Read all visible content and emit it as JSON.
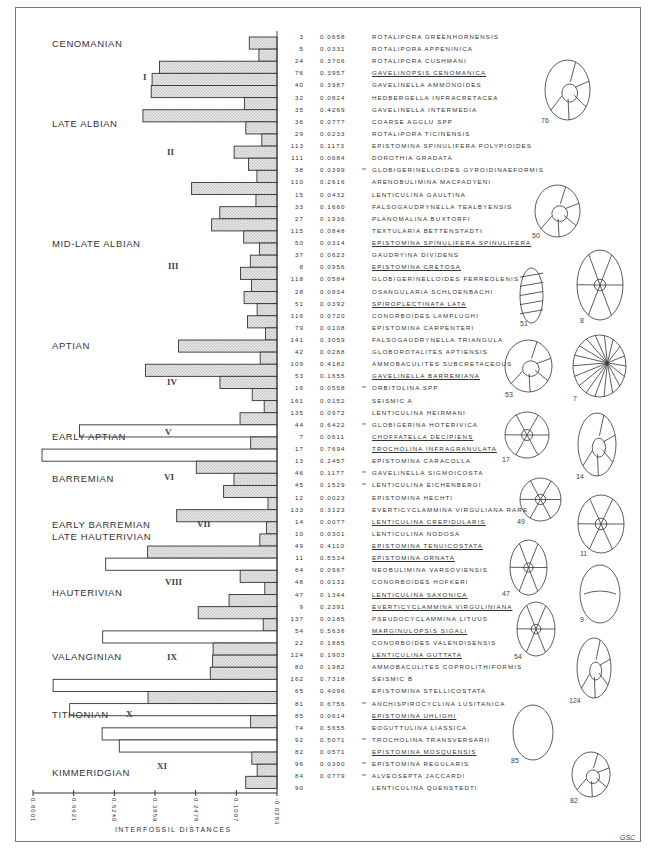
{
  "figure": {
    "credit": "GSC",
    "axis_title": "INTERFOSSIL DISTANCES",
    "axis_ticks": [
      "0.8001",
      "0.6621",
      "0.5240",
      "0.3859",
      "0.2478",
      "0.1097",
      "-0.0283"
    ]
  },
  "stages": [
    {
      "label": "CENOMANIAN",
      "top": 37
    },
    {
      "label": "LATE ALBIAN",
      "top": 117
    },
    {
      "label": "MID-LATE ALBIAN",
      "top": 237
    },
    {
      "label": "APTIAN",
      "top": 339
    },
    {
      "label": "EARLY APTIAN",
      "top": 430
    },
    {
      "label": "BARREMIAN",
      "top": 472
    },
    {
      "label": "EARLY BARREMIAN",
      "top": 518
    },
    {
      "label": "LATE HAUTERIVIAN",
      "top": 530
    },
    {
      "label": "HAUTERIVIAN",
      "top": 586
    },
    {
      "label": "VALANGINIAN",
      "top": 650
    },
    {
      "label": "TITHONIAN",
      "top": 708
    },
    {
      "label": "KIMMERIDGIAN",
      "top": 766
    }
  ],
  "clusters": [
    {
      "label": "I",
      "left": 143,
      "top": 72
    },
    {
      "label": "II",
      "left": 167,
      "top": 147
    },
    {
      "label": "III",
      "left": 168,
      "top": 261
    },
    {
      "label": "IV",
      "left": 167,
      "top": 377
    },
    {
      "label": "V",
      "left": 165,
      "top": 427
    },
    {
      "label": "VI",
      "left": 164,
      "top": 472
    },
    {
      "label": "VII",
      "left": 197,
      "top": 519
    },
    {
      "label": "VIII",
      "left": 165,
      "top": 577
    },
    {
      "label": "IX",
      "left": 167,
      "top": 652
    },
    {
      "label": "X",
      "left": 126,
      "top": 709
    },
    {
      "label": "XI",
      "left": 157,
      "top": 761
    }
  ],
  "chart_data": {
    "type": "dendrogram",
    "title": "",
    "xlabel": "INTERFOSSIL DISTANCES",
    "xlim": [
      0.8001,
      -0.0283
    ],
    "x_ticks": [
      0.8001,
      0.6621,
      0.524,
      0.3859,
      0.2478,
      0.1097,
      -0.0283
    ],
    "columns": [
      "Taxon no.",
      "Interfossil distance",
      "Taxon"
    ],
    "note": "** marks taxa flagged with double asterisk; underlined taxa are illustrated",
    "rows": [
      {
        "no": "3",
        "dist": "0.0658",
        "name": "ROTALIPORA GREENHORNENSIS",
        "mark": "",
        "u": false
      },
      {
        "no": "5",
        "dist": "0.0331",
        "name": "ROTALIPORA APPENINICA",
        "mark": "",
        "u": false
      },
      {
        "no": "24",
        "dist": "0.3706",
        "name": "ROTALIPORA CUSHMANI",
        "mark": "",
        "u": false
      },
      {
        "no": "76",
        "dist": "0.3957",
        "name": "GAVELINOPSIS CENOMANICA",
        "mark": "",
        "u": true
      },
      {
        "no": "40",
        "dist": "0.3987",
        "name": "GAVELINELLA AMMONOIDES",
        "mark": "",
        "u": false
      },
      {
        "no": "32",
        "dist": "0.0824",
        "name": "HEDBERGELLA INFRACRETACEA",
        "mark": "",
        "u": false
      },
      {
        "no": "35",
        "dist": "0.4269",
        "name": "GAVELINELLA INTERMEDIA",
        "mark": "",
        "u": false
      },
      {
        "no": "36",
        "dist": "0.0777",
        "name": "COARSE AGGLU SPP",
        "mark": "",
        "u": false
      },
      {
        "no": "29",
        "dist": "0.0233",
        "name": "ROTALIPORA TICINENSIS",
        "mark": "",
        "u": false
      },
      {
        "no": "113",
        "dist": "0.1173",
        "name": "EPISTOMINA SPINULIFERA POLYPIOIDES",
        "mark": "",
        "u": false
      },
      {
        "no": "111",
        "dist": "0.0684",
        "name": "DOROTHIA GRADATA",
        "mark": "",
        "u": false
      },
      {
        "no": "38",
        "dist": "0.0399",
        "name": "GLOBIGERINELLOIDES GYROIDINAEFORMIS",
        "mark": "**",
        "u": false
      },
      {
        "no": "110",
        "dist": "0.2616",
        "name": "ARENOBULIMINA MACFADYENI",
        "mark": "",
        "u": false
      },
      {
        "no": "15",
        "dist": "0.0432",
        "name": "LENTICULINA GAULTINA",
        "mark": "",
        "u": false
      },
      {
        "no": "33",
        "dist": "0.1660",
        "name": "FALSOGAUDRYNELLA TEALBYENSIS",
        "mark": "",
        "u": false
      },
      {
        "no": "27",
        "dist": "0.1936",
        "name": "PLANOMALINA BUXTORFI",
        "mark": "",
        "u": false
      },
      {
        "no": "115",
        "dist": "0.0848",
        "name": "TEXTULARIA BETTENSTADTI",
        "mark": "",
        "u": false
      },
      {
        "no": "50",
        "dist": "0.0314",
        "name": "EPISTOMINA SPINULIFERA SPINULIFERA",
        "mark": "",
        "u": true
      },
      {
        "no": "37",
        "dist": "0.0623",
        "name": "GAUDRYINA DIVIDENS",
        "mark": "",
        "u": false
      },
      {
        "no": "8",
        "dist": "0.0956",
        "name": "EPISTOMINA CRETOSA",
        "mark": "",
        "u": true
      },
      {
        "no": "118",
        "dist": "0.0584",
        "name": "GLOBIGERINELLOIDES FERREOLENIS",
        "mark": "",
        "u": false
      },
      {
        "no": "28",
        "dist": "0.0834",
        "name": "OSANGULARIA SCHLOENBACHI",
        "mark": "",
        "u": false
      },
      {
        "no": "51",
        "dist": "0.0392",
        "name": "SPIROPLECTINATA LATA",
        "mark": "",
        "u": true
      },
      {
        "no": "116",
        "dist": "0.0720",
        "name": "CONORBOIDES LAMPLUGHI",
        "mark": "",
        "u": false
      },
      {
        "no": "79",
        "dist": "0.0108",
        "name": "EPISTOMINA CARPENTERI",
        "mark": "",
        "u": false
      },
      {
        "no": "141",
        "dist": "0.3059",
        "name": "FALSOGAUDRYNELLA TRIANGULA",
        "mark": "",
        "u": false
      },
      {
        "no": "42",
        "dist": "0.0288",
        "name": "GLOBOROTALITES APTIENSIS",
        "mark": "",
        "u": false
      },
      {
        "no": "109",
        "dist": "0.4182",
        "name": "AMMOBACULITES SUBCRETACEOUS",
        "mark": "",
        "u": false
      },
      {
        "no": "53",
        "dist": "0.1655",
        "name": "GAVELINELLA BARREMIANA",
        "mark": "",
        "u": true
      },
      {
        "no": "16",
        "dist": "0.0558",
        "name": "ORBITOLINA SPP",
        "mark": "**",
        "u": false
      },
      {
        "no": "161",
        "dist": "0.0152",
        "name": "SEISMIC A",
        "mark": "",
        "u": false
      },
      {
        "no": "135",
        "dist": "0.0972",
        "name": "LENTICULINA HEIRMANI",
        "mark": "",
        "u": false
      },
      {
        "no": "44",
        "dist": "0.6422",
        "name": "GLOBIGERINA HOTERIVICA",
        "mark": "**",
        "u": false
      },
      {
        "no": "7",
        "dist": "0.0611",
        "name": "CHOFFATELLA DECIPIENS",
        "mark": "",
        "u": true
      },
      {
        "no": "17",
        "dist": "0.7694",
        "name": "TROCHOLINA INFRAGRANULATA",
        "mark": "",
        "u": true
      },
      {
        "no": "13",
        "dist": "0.2457",
        "name": "EPISTOMINA CARACOLLA",
        "mark": "",
        "u": false
      },
      {
        "no": "46",
        "dist": "0.1177",
        "name": "GAVELINELLA SIGMOICOSTA",
        "mark": "**",
        "u": false
      },
      {
        "no": "45",
        "dist": "0.1529",
        "name": "LENTICULINA EICHENBERGI",
        "mark": "**",
        "u": false
      },
      {
        "no": "12",
        "dist": "0.0023",
        "name": "EPISTOMINA HECHTI",
        "mark": "",
        "u": false
      },
      {
        "no": "133",
        "dist": "0.3123",
        "name": "EVERTICYCLAMMINA VIRGULIANA RARE",
        "mark": "",
        "u": false
      },
      {
        "no": "14",
        "dist": "0.0077",
        "name": "LENTICULINA CREPIDULARIS",
        "mark": "",
        "u": true
      },
      {
        "no": "10",
        "dist": "0.0301",
        "name": "LENTICULINA NODOSA",
        "mark": "",
        "u": false
      },
      {
        "no": "49",
        "dist": "0.4110",
        "name": "EPISTOMINA TENUICOSTATA",
        "mark": "",
        "u": true
      },
      {
        "no": "11",
        "dist": "0.5534",
        "name": "EPISTOMINA ORNATA",
        "mark": "",
        "u": true
      },
      {
        "no": "64",
        "dist": "0.0967",
        "name": "NEOBULIMINA VARSOVIENSIS",
        "mark": "",
        "u": false
      },
      {
        "no": "48",
        "dist": "0.0132",
        "name": "CONORBOIDES HOFKERI",
        "mark": "",
        "u": false
      },
      {
        "no": "47",
        "dist": "0.1344",
        "name": "LENTICULINA SAXONICA",
        "mark": "",
        "u": true
      },
      {
        "no": "9",
        "dist": "0.2391",
        "name": "EVERTICYCLAMMINA VIRGULINIANA",
        "mark": "",
        "u": true
      },
      {
        "no": "137",
        "dist": "0.0185",
        "name": "PSEUDOCYCLAMMINA LITUUS",
        "mark": "",
        "u": false
      },
      {
        "no": "54",
        "dist": "0.5636",
        "name": "MARGINULOPSIS SIGALI",
        "mark": "",
        "u": true
      },
      {
        "no": "22",
        "dist": "0.1885",
        "name": "CONORBOIDES VALENDISENSIS",
        "mark": "",
        "u": false
      },
      {
        "no": "124",
        "dist": "0.1903",
        "name": "LENTICULINA GUTTATA",
        "mark": "",
        "u": true
      },
      {
        "no": "80",
        "dist": "0.1982",
        "name": "AMMOBACULITES COPROLITHIFORMIS",
        "mark": "",
        "u": false
      },
      {
        "no": "162",
        "dist": "0.7318",
        "name": "SEISMIC B",
        "mark": "",
        "u": false
      },
      {
        "no": "65",
        "dist": "0.4096",
        "name": "EPISTOMINA STELLICOSTATA",
        "mark": "",
        "u": false
      },
      {
        "no": "81",
        "dist": "0.6756",
        "name": "ANCHISPIROCYCLINA LUSITANICA",
        "mark": "**",
        "u": false
      },
      {
        "no": "85",
        "dist": "0.0614",
        "name": "EPISTOMINA UHLIGHI",
        "mark": "",
        "u": true
      },
      {
        "no": "74",
        "dist": "0.5655",
        "name": "EOGUTTULINA LIASSICA",
        "mark": "",
        "u": false
      },
      {
        "no": "92",
        "dist": "0.5071",
        "name": "TROCHOLINA TRANSVERSARII",
        "mark": "**",
        "u": false
      },
      {
        "no": "82",
        "dist": "0.0571",
        "name": "EPISTOMINA MOSQUENSIS",
        "mark": "",
        "u": true
      },
      {
        "no": "96",
        "dist": "0.0390",
        "name": "EPISTOMINA REGULARIS",
        "mark": "**",
        "u": false
      },
      {
        "no": "84",
        "dist": "0.0779",
        "name": "ALVEOSEPTA JACCARDI",
        "mark": "**",
        "u": false
      },
      {
        "no": "90",
        "dist": "",
        "name": "LENTICULINA QUENSTEDTI",
        "mark": "",
        "u": false
      }
    ]
  },
  "illustrations": [
    {
      "label": "76",
      "shape": "planispiral",
      "x": 545,
      "y": 60,
      "w": 45,
      "h": 60,
      "lx": 541,
      "ly": 117
    },
    {
      "label": "50",
      "shape": "trochospiral-umbilical",
      "x": 535,
      "y": 185,
      "w": 45,
      "h": 52,
      "lx": 532,
      "ly": 232
    },
    {
      "label": "51",
      "shape": "biserial",
      "x": 520,
      "y": 268,
      "w": 23,
      "h": 55,
      "lx": 520,
      "ly": 320
    },
    {
      "label": "8",
      "shape": "chambered-polygonal",
      "x": 577,
      "y": 250,
      "w": 46,
      "h": 70,
      "lx": 580,
      "ly": 317
    },
    {
      "label": "53",
      "shape": "trochospiral",
      "x": 505,
      "y": 340,
      "w": 47,
      "h": 52,
      "lx": 505,
      "ly": 391
    },
    {
      "label": "7",
      "shape": "radial-striate",
      "x": 573,
      "y": 335,
      "w": 53,
      "h": 62,
      "lx": 573,
      "ly": 395
    },
    {
      "label": "17",
      "shape": "disc-ornamented",
      "x": 505,
      "y": 412,
      "w": 44,
      "h": 46,
      "lx": 502,
      "ly": 456
    },
    {
      "label": "14",
      "shape": "elongate-planispiral",
      "x": 578,
      "y": 413,
      "w": 38,
      "h": 63,
      "lx": 576,
      "ly": 473
    },
    {
      "label": "49",
      "shape": "radial-sutured",
      "x": 520,
      "y": 478,
      "w": 41,
      "h": 43,
      "lx": 517,
      "ly": 518
    },
    {
      "label": "11",
      "shape": "chambered-polygonal",
      "x": 578,
      "y": 495,
      "w": 46,
      "h": 58,
      "lx": 580,
      "ly": 550
    },
    {
      "label": "47",
      "shape": "lobate",
      "x": 510,
      "y": 540,
      "w": 37,
      "h": 55,
      "lx": 502,
      "ly": 590
    },
    {
      "label": "9",
      "shape": "dome",
      "x": 580,
      "y": 565,
      "w": 40,
      "h": 58,
      "lx": 580,
      "ly": 616
    },
    {
      "label": "54",
      "shape": "alveolar",
      "x": 517,
      "y": 602,
      "w": 38,
      "h": 54,
      "lx": 514,
      "ly": 653
    },
    {
      "label": "124",
      "shape": "evolute-planispiral",
      "x": 577,
      "y": 638,
      "w": 34,
      "h": 60,
      "lx": 569,
      "ly": 697
    },
    {
      "label": "85",
      "shape": "smooth-ovoid",
      "x": 513,
      "y": 705,
      "w": 40,
      "h": 55,
      "lx": 511,
      "ly": 757
    },
    {
      "label": "82",
      "shape": "hexagonal-trochospiral",
      "x": 572,
      "y": 752,
      "w": 38,
      "h": 45,
      "lx": 570,
      "ly": 797
    }
  ]
}
